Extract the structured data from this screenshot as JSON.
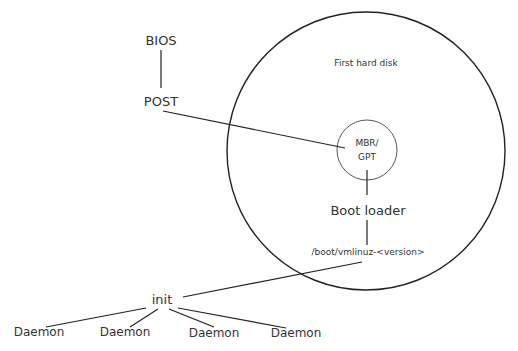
{
  "diagram": {
    "nodes": {
      "bios": "BIOS",
      "post": "POST",
      "disk": "First hard disk",
      "mbr_line1": "MBR/",
      "mbr_line2": "GPT",
      "bootloader": "Boot loader",
      "kernel": "/boot/vmlinuz-<version>",
      "init": "init",
      "daemons": [
        "Daemon",
        "Daemon",
        "Daemon",
        "Daemon"
      ]
    },
    "colors": {
      "line": "#222222",
      "text": "#333333",
      "background": "#ffffff"
    }
  }
}
